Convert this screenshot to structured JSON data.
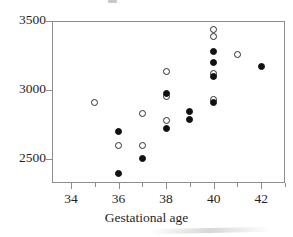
{
  "chart_data": {
    "type": "scatter",
    "title": "",
    "subtitle": "",
    "xlabel": "Gestational age",
    "ylabel": "",
    "xlim": [
      33.2,
      43.0
    ],
    "ylim": [
      2330,
      3500
    ],
    "xticks": [
      34,
      36,
      38,
      40,
      42
    ],
    "xtick_labels": [
      "34",
      "36",
      "38",
      "40",
      "42"
    ],
    "yticks": [
      2500,
      3000,
      3500
    ],
    "ytick_labels": [
      "2500",
      "3000",
      "3500"
    ],
    "grid": false,
    "legend": false,
    "legend_position": "none",
    "marker_size_px": 7,
    "series": [
      {
        "name": "open-circles",
        "marker": "open-circle",
        "color": "#2b2b2b",
        "fill": "#ffffff",
        "points": [
          {
            "x": 35,
            "y": 2910
          },
          {
            "x": 36,
            "y": 2600
          },
          {
            "x": 37,
            "y": 2830
          },
          {
            "x": 37,
            "y": 2600
          },
          {
            "x": 38,
            "y": 3135
          },
          {
            "x": 38,
            "y": 2955
          },
          {
            "x": 38,
            "y": 2780
          },
          {
            "x": 40,
            "y": 3440
          },
          {
            "x": 40,
            "y": 3390
          },
          {
            "x": 40,
            "y": 3120
          },
          {
            "x": 40,
            "y": 2930
          },
          {
            "x": 41,
            "y": 3260
          }
        ]
      },
      {
        "name": "filled-circles",
        "marker": "filled-circle",
        "color": "#111111",
        "fill": "#111111",
        "points": [
          {
            "x": 36,
            "y": 2700
          },
          {
            "x": 36,
            "y": 2400
          },
          {
            "x": 37,
            "y": 2510
          },
          {
            "x": 38,
            "y": 2975
          },
          {
            "x": 38,
            "y": 2725
          },
          {
            "x": 39,
            "y": 2850
          },
          {
            "x": 39,
            "y": 2790
          },
          {
            "x": 40,
            "y": 3280
          },
          {
            "x": 40,
            "y": 3200
          },
          {
            "x": 40,
            "y": 3100
          },
          {
            "x": 40,
            "y": 2915
          },
          {
            "x": 42,
            "y": 3170
          }
        ]
      }
    ]
  },
  "axis": {
    "x_title": "Gestational age",
    "x_tick_labels": [
      "34",
      "36",
      "38",
      "40",
      "42"
    ],
    "y_tick_labels": [
      "3500",
      "3000",
      "2500"
    ]
  },
  "colors": {
    "frame": "#8d8d8d",
    "text": "#1f1f1f",
    "filled_marker": "#111111",
    "open_marker_edge": "#2b2b2b",
    "background": "#ffffff"
  }
}
